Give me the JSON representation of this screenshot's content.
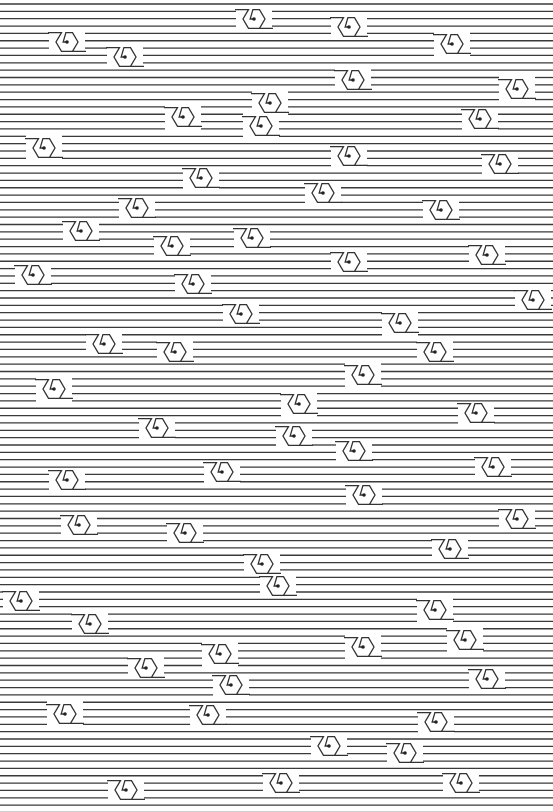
{
  "artwork": {
    "width": 553,
    "height": 812,
    "background": "#ffffff",
    "line_color": "#3a3a3a",
    "line_start_y": 4,
    "line_spacing": 7.35,
    "line_count": 111,
    "knot_size": 11,
    "knots": [
      {
        "x": 254,
        "y": 19
      },
      {
        "x": 349,
        "y": 27
      },
      {
        "x": 67,
        "y": 42
      },
      {
        "x": 452,
        "y": 44
      },
      {
        "x": 125,
        "y": 57
      },
      {
        "x": 353,
        "y": 80
      },
      {
        "x": 517,
        "y": 89
      },
      {
        "x": 270,
        "y": 103
      },
      {
        "x": 183,
        "y": 117
      },
      {
        "x": 480,
        "y": 119
      },
      {
        "x": 261,
        "y": 126
      },
      {
        "x": 44,
        "y": 148
      },
      {
        "x": 349,
        "y": 156
      },
      {
        "x": 500,
        "y": 164
      },
      {
        "x": 201,
        "y": 178
      },
      {
        "x": 323,
        "y": 193
      },
      {
        "x": 137,
        "y": 208
      },
      {
        "x": 441,
        "y": 210
      },
      {
        "x": 81,
        "y": 231
      },
      {
        "x": 252,
        "y": 238
      },
      {
        "x": 172,
        "y": 246
      },
      {
        "x": 487,
        "y": 255
      },
      {
        "x": 349,
        "y": 262
      },
      {
        "x": 33,
        "y": 275
      },
      {
        "x": 193,
        "y": 284
      },
      {
        "x": 533,
        "y": 300
      },
      {
        "x": 241,
        "y": 314
      },
      {
        "x": 400,
        "y": 323
      },
      {
        "x": 104,
        "y": 344
      },
      {
        "x": 175,
        "y": 352
      },
      {
        "x": 435,
        "y": 352
      },
      {
        "x": 363,
        "y": 375
      },
      {
        "x": 54,
        "y": 389
      },
      {
        "x": 299,
        "y": 404
      },
      {
        "x": 476,
        "y": 413
      },
      {
        "x": 157,
        "y": 428
      },
      {
        "x": 294,
        "y": 436
      },
      {
        "x": 354,
        "y": 451
      },
      {
        "x": 493,
        "y": 467
      },
      {
        "x": 222,
        "y": 472
      },
      {
        "x": 67,
        "y": 480
      },
      {
        "x": 364,
        "y": 495
      },
      {
        "x": 517,
        "y": 519
      },
      {
        "x": 79,
        "y": 525
      },
      {
        "x": 185,
        "y": 533
      },
      {
        "x": 450,
        "y": 549
      },
      {
        "x": 262,
        "y": 564
      },
      {
        "x": 278,
        "y": 586
      },
      {
        "x": 21,
        "y": 601
      },
      {
        "x": 435,
        "y": 610
      },
      {
        "x": 90,
        "y": 624
      },
      {
        "x": 465,
        "y": 640
      },
      {
        "x": 363,
        "y": 647
      },
      {
        "x": 220,
        "y": 654
      },
      {
        "x": 146,
        "y": 668
      },
      {
        "x": 487,
        "y": 679
      },
      {
        "x": 231,
        "y": 685
      },
      {
        "x": 65,
        "y": 714
      },
      {
        "x": 208,
        "y": 715
      },
      {
        "x": 436,
        "y": 722
      },
      {
        "x": 329,
        "y": 746
      },
      {
        "x": 405,
        "y": 753
      },
      {
        "x": 281,
        "y": 783
      },
      {
        "x": 461,
        "y": 783
      },
      {
        "x": 126,
        "y": 790
      }
    ]
  }
}
